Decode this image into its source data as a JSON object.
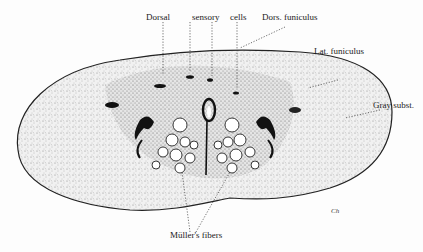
{
  "figure": {
    "labels": {
      "dorsal": "Dorsal",
      "sensory": "sensory",
      "cells": "cells",
      "dors_funiculus": "Dors. funiculus",
      "lat_funiculus": "Lat. funiculus",
      "gray_subst": "Gray subst.",
      "muller_fibers": "Müller's fibers"
    },
    "signature": "Ch",
    "colors": {
      "ink": "#1a1a1a",
      "stipple": "#555555",
      "paper": "#fdfdfd"
    }
  }
}
